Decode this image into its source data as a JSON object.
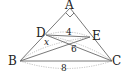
{
  "figure": {
    "points": {
      "A": {
        "label": "A",
        "x": 70,
        "y": 8
      },
      "B": {
        "label": "B",
        "x": 20,
        "y": 61
      },
      "C": {
        "label": "C",
        "x": 112,
        "y": 61
      },
      "D": {
        "label": "D",
        "x": 46,
        "y": 35
      },
      "E": {
        "label": "E",
        "x": 90,
        "y": 37
      }
    },
    "right_angle_at": "A",
    "measures": {
      "DE": "4",
      "x": "x",
      "DC": "6",
      "BC": "8"
    }
  }
}
